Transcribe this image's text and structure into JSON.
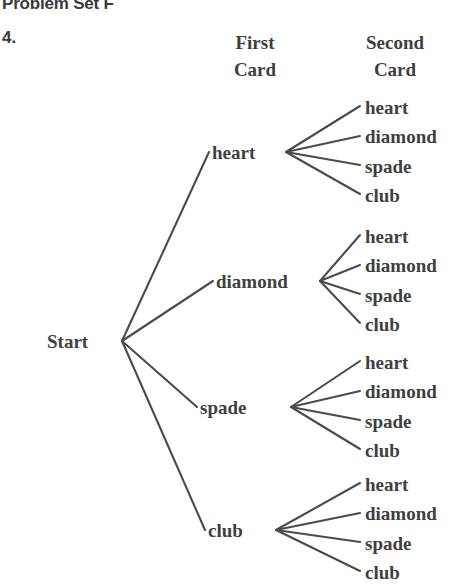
{
  "page": {
    "title": "Problem Set F",
    "problem_number": "4.",
    "background_color": "#ffffff",
    "ink_color": "#3f3f41",
    "line_color": "#4b4b4d"
  },
  "headers": {
    "first_card": {
      "line1": "First",
      "line2": "Card"
    },
    "second_card": {
      "line1": "Second",
      "line2": "Card"
    }
  },
  "tree": {
    "root": {
      "label": "Start",
      "x": 47,
      "y": 332,
      "anchor_x": 122,
      "anchor_y": 341
    },
    "branches": [
      {
        "label": "heart",
        "x": 212,
        "y": 143,
        "left_anchor_x": 209,
        "left_anchor_y": 152,
        "right_anchor_x": 286,
        "right_anchor_y": 152,
        "leaves": [
          {
            "label": "heart",
            "x": 365,
            "y": 98,
            "anchor_x": 360,
            "anchor_y": 106
          },
          {
            "label": "diamond",
            "x": 365,
            "y": 127,
            "anchor_x": 360,
            "anchor_y": 136
          },
          {
            "label": "spade",
            "x": 365,
            "y": 157,
            "anchor_x": 360,
            "anchor_y": 165
          },
          {
            "label": "club",
            "x": 365,
            "y": 186,
            "anchor_x": 360,
            "anchor_y": 194
          }
        ]
      },
      {
        "label": "diamond",
        "x": 216,
        "y": 272,
        "left_anchor_x": 213,
        "left_anchor_y": 281,
        "right_anchor_x": 320,
        "right_anchor_y": 281,
        "leaves": [
          {
            "label": "heart",
            "x": 365,
            "y": 227,
            "anchor_x": 360,
            "anchor_y": 235
          },
          {
            "label": "diamond",
            "x": 365,
            "y": 256,
            "anchor_x": 360,
            "anchor_y": 265
          },
          {
            "label": "spade",
            "x": 365,
            "y": 286,
            "anchor_x": 360,
            "anchor_y": 294
          },
          {
            "label": "club",
            "x": 365,
            "y": 315,
            "anchor_x": 360,
            "anchor_y": 323
          }
        ]
      },
      {
        "label": "spade",
        "x": 200,
        "y": 398,
        "left_anchor_x": 197,
        "left_anchor_y": 407,
        "right_anchor_x": 291,
        "right_anchor_y": 407,
        "leaves": [
          {
            "label": "heart",
            "x": 365,
            "y": 353,
            "anchor_x": 360,
            "anchor_y": 361
          },
          {
            "label": "diamond",
            "x": 365,
            "y": 382,
            "anchor_x": 360,
            "anchor_y": 391
          },
          {
            "label": "spade",
            "x": 365,
            "y": 412,
            "anchor_x": 360,
            "anchor_y": 420
          },
          {
            "label": "club",
            "x": 365,
            "y": 441,
            "anchor_x": 360,
            "anchor_y": 449
          }
        ]
      },
      {
        "label": "club",
        "x": 208,
        "y": 521,
        "left_anchor_x": 205,
        "left_anchor_y": 530,
        "right_anchor_x": 276,
        "right_anchor_y": 530,
        "leaves": [
          {
            "label": "heart",
            "x": 365,
            "y": 475,
            "anchor_x": 360,
            "anchor_y": 483
          },
          {
            "label": "diamond",
            "x": 365,
            "y": 504,
            "anchor_x": 360,
            "anchor_y": 513
          },
          {
            "label": "spade",
            "x": 365,
            "y": 534,
            "anchor_x": 360,
            "anchor_y": 542
          },
          {
            "label": "club",
            "x": 365,
            "y": 563,
            "anchor_x": 360,
            "anchor_y": 571
          }
        ]
      }
    ]
  }
}
